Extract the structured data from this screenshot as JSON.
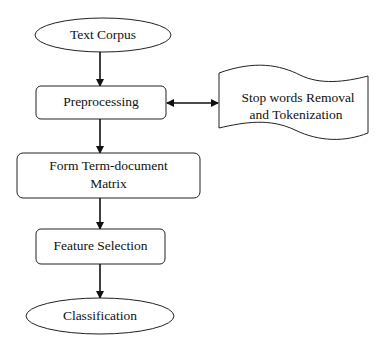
{
  "diagram": {
    "nodes": {
      "text_corpus": "Text Corpus",
      "preprocessing": "Preprocessing",
      "stop_words_line1": "Stop words Removal",
      "stop_words_line2": "and Tokenization",
      "term_matrix_line1": "Form Term-document",
      "term_matrix_line2": "Matrix",
      "feature_selection": "Feature Selection",
      "classification": "Classification"
    },
    "edges": [
      {
        "from": "Text Corpus",
        "to": "Preprocessing"
      },
      {
        "from": "Preprocessing",
        "to": "Stop words Removal and Tokenization",
        "bidirectional": true
      },
      {
        "from": "Preprocessing",
        "to": "Form Term-document Matrix"
      },
      {
        "from": "Form Term-document Matrix",
        "to": "Feature Selection"
      },
      {
        "from": "Feature Selection",
        "to": "Classification"
      }
    ]
  }
}
